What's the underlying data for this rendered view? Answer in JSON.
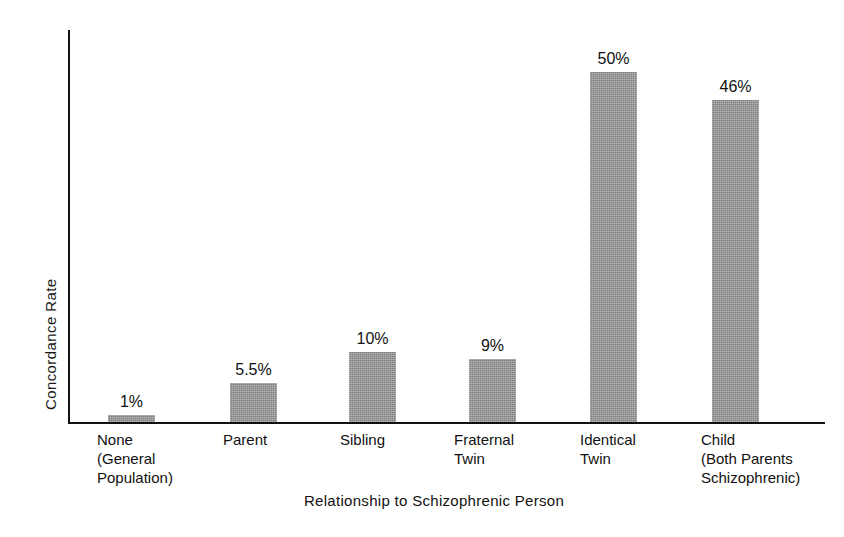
{
  "chart_data": {
    "type": "bar",
    "title": "",
    "xlabel": "Relationship to Schizophrenic Person",
    "ylabel": "Concordance Rate",
    "categories": [
      "None (General Population)",
      "Parent",
      "Sibling",
      "Fraternal Twin",
      "Identical Twin",
      "Child (Both Parents Schizophrenic)"
    ],
    "category_lines": [
      [
        "None",
        "(General",
        "Population)"
      ],
      [
        "Parent"
      ],
      [
        "Sibling"
      ],
      [
        "Fraternal",
        "Twin"
      ],
      [
        "Identical",
        "Twin"
      ],
      [
        "Child",
        "(Both Parents",
        "Schizophrenic)"
      ]
    ],
    "values": [
      1,
      5.5,
      10,
      9,
      50,
      46
    ],
    "value_labels": [
      "1%",
      "5.5%",
      "10%",
      "9%",
      "50%",
      "46%"
    ],
    "ylim": [
      0,
      56
    ],
    "grid": false,
    "legend": null,
    "bar_color": "#9b9b9b",
    "axis_color": "#111111",
    "background_color": "#ffffff"
  }
}
